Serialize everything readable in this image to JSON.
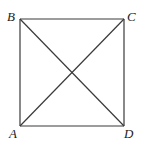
{
  "figure": {
    "type": "square-with-diagonals",
    "vertices": {
      "A": {
        "label": "A",
        "x": 20,
        "y": 126,
        "label_x": 9,
        "label_y": 138
      },
      "B": {
        "label": "B",
        "x": 20,
        "y": 19,
        "label_x": 7,
        "label_y": 21
      },
      "C": {
        "label": "C",
        "x": 124,
        "y": 19,
        "label_x": 127,
        "label_y": 21
      },
      "D": {
        "label": "D",
        "x": 124,
        "y": 126,
        "label_x": 124,
        "label_y": 138
      }
    },
    "edges": [
      [
        "A",
        "B"
      ],
      [
        "B",
        "C"
      ],
      [
        "C",
        "D"
      ],
      [
        "D",
        "A"
      ]
    ],
    "diagonals": [
      [
        "B",
        "D"
      ],
      [
        "A",
        "C"
      ]
    ],
    "line_color": "#3a3a3a",
    "label_color": "#222222"
  }
}
